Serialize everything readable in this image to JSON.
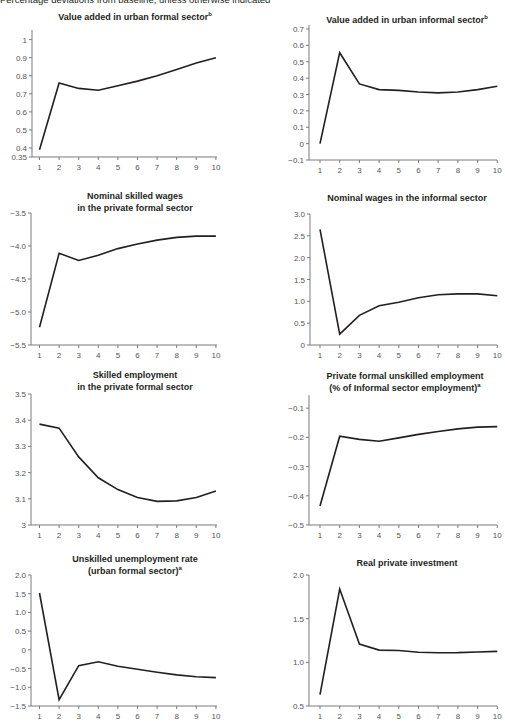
{
  "caption": "Percentage deviations from baseline, unless otherwise indicated",
  "chart_data": [
    {
      "type": "line",
      "title": "Value added in urban formal sector",
      "title_sup": "b",
      "x": [
        1,
        2,
        3,
        4,
        5,
        6,
        7,
        8,
        9,
        10
      ],
      "values": [
        0.39,
        0.76,
        0.73,
        0.72,
        0.745,
        0.77,
        0.8,
        0.835,
        0.87,
        0.9
      ],
      "yticks": [
        0.35,
        0.4,
        0.5,
        0.6,
        0.7,
        0.8,
        0.9,
        1
      ],
      "ytick_labels": [
        "0.35",
        "0.4",
        "0.5",
        "0.6",
        "0.7",
        "0.8",
        "0.9",
        "1"
      ],
      "ylim": [
        0.35,
        1.02
      ],
      "xlabel": "",
      "ylabel": "",
      "grid": false
    },
    {
      "type": "line",
      "title": "Value added in urban informal sector",
      "title_sup": "b",
      "x": [
        1,
        2,
        3,
        4,
        5,
        6,
        7,
        8,
        9,
        10
      ],
      "values": [
        0.0,
        0.555,
        0.365,
        0.33,
        0.325,
        0.315,
        0.31,
        0.315,
        0.33,
        0.35
      ],
      "yticks": [
        -0.1,
        0,
        0.1,
        0.2,
        0.3,
        0.4,
        0.5,
        0.6,
        0.7
      ],
      "ytick_labels": [
        "−0.1",
        "0",
        "0.1",
        "0.2",
        "0.3",
        "0.4",
        "0.5",
        "0.6",
        "0.7"
      ],
      "ylim": [
        -0.1,
        0.7
      ],
      "xlabel": "",
      "ylabel": "",
      "grid": false
    },
    {
      "type": "line",
      "title": "Nominal skilled wages",
      "title_line2": "in the private formal sector",
      "x": [
        1,
        2,
        3,
        4,
        5,
        6,
        7,
        8,
        9,
        10
      ],
      "values": [
        -5.23,
        -4.11,
        -4.22,
        -4.14,
        -4.04,
        -3.97,
        -3.91,
        -3.87,
        -3.85,
        -3.85
      ],
      "yticks": [
        -5.5,
        -5.0,
        -4.5,
        -4.0,
        -3.5
      ],
      "ytick_labels": [
        "−5.5",
        "−5.0",
        "−4.5",
        "−4.0",
        "−3.5"
      ],
      "ylim": [
        -5.5,
        -3.5
      ],
      "xlabel": "",
      "ylabel": "",
      "grid": false
    },
    {
      "type": "line",
      "title": "Nominal wages in the informal sector",
      "x": [
        1,
        2,
        3,
        4,
        5,
        6,
        7,
        8,
        9,
        10
      ],
      "values": [
        2.65,
        0.25,
        0.68,
        0.9,
        0.98,
        1.08,
        1.15,
        1.17,
        1.17,
        1.13
      ],
      "yticks": [
        0,
        0.5,
        1.0,
        1.5,
        2.0,
        2.5,
        3.0
      ],
      "ytick_labels": [
        "0",
        "0.5",
        "1.0",
        "1.5",
        "2.0",
        "2.5",
        "3.0"
      ],
      "ylim": [
        0,
        3.0
      ],
      "xlabel": "",
      "ylabel": "",
      "grid": false
    },
    {
      "type": "line",
      "title": "Skilled employment",
      "title_line2": "in the private formal sector",
      "x": [
        1,
        2,
        3,
        4,
        5,
        6,
        7,
        8,
        9,
        10
      ],
      "values": [
        3.385,
        3.37,
        3.26,
        3.18,
        3.135,
        3.105,
        3.09,
        3.092,
        3.105,
        3.13
      ],
      "yticks": [
        3,
        3.1,
        3.2,
        3.3,
        3.4,
        3.5
      ],
      "ytick_labels": [
        "3",
        "3.1",
        "3.2",
        "3.3",
        "3.4",
        "3.5"
      ],
      "ylim": [
        3,
        3.5
      ],
      "xlabel": "",
      "ylabel": "",
      "grid": false
    },
    {
      "type": "line",
      "title": "Private formal unskilled employment",
      "title_line2": "(% of Informal sector employment)",
      "title_sup": "a",
      "x": [
        1,
        2,
        3,
        4,
        5,
        6,
        7,
        8,
        9,
        10
      ],
      "values": [
        -0.435,
        -0.196,
        -0.207,
        -0.213,
        -0.202,
        -0.19,
        -0.18,
        -0.171,
        -0.165,
        -0.163
      ],
      "yticks": [
        -0.5,
        -0.4,
        -0.3,
        -0.2,
        -0.1
      ],
      "ytick_labels": [
        "−0.5",
        "−0.4",
        "−0.3",
        "−0.2",
        "−0.1"
      ],
      "ylim": [
        -0.5,
        -0.055
      ],
      "xlabel": "",
      "ylabel": "",
      "grid": false
    },
    {
      "type": "line",
      "title": "Unskilled unemployment rate",
      "title_line2": "(urban formal sector)",
      "title_sup": "a",
      "x": [
        1,
        2,
        3,
        4,
        5,
        6,
        7,
        8,
        9,
        10
      ],
      "values": [
        1.52,
        -1.33,
        -0.42,
        -0.32,
        -0.44,
        -0.52,
        -0.6,
        -0.67,
        -0.72,
        -0.74
      ],
      "yticks": [
        -1.5,
        -1.0,
        -0.5,
        0,
        0.5,
        1.0,
        1.5,
        2.0
      ],
      "ytick_labels": [
        "−1.5",
        "−1.0",
        "−0.5",
        "0",
        "0.5",
        "1.0",
        "1.5",
        "2.0"
      ],
      "ylim": [
        -1.5,
        2.0
      ],
      "xlabel": "",
      "ylabel": "",
      "grid": false
    },
    {
      "type": "line",
      "title": "Real private investment",
      "x": [
        1,
        2,
        3,
        4,
        5,
        6,
        7,
        8,
        9,
        10
      ],
      "values": [
        0.63,
        1.84,
        1.21,
        1.14,
        1.135,
        1.115,
        1.11,
        1.112,
        1.118,
        1.125
      ],
      "yticks": [
        0.5,
        1.0,
        1.5,
        2.0
      ],
      "ytick_labels": [
        "0.5",
        "1.0",
        "1.5",
        "2.0"
      ],
      "ylim": [
        0.5,
        2.0
      ],
      "xlabel": "",
      "ylabel": "",
      "grid": false
    }
  ]
}
